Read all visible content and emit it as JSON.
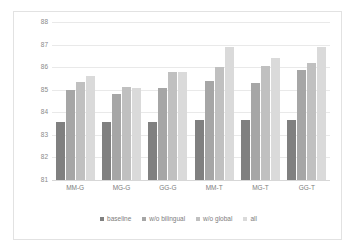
{
  "chart_data": {
    "type": "bar",
    "title": "",
    "xlabel": "",
    "ylabel": "",
    "ylim": [
      81,
      88
    ],
    "yticks": [
      88,
      87,
      86,
      85,
      84,
      83,
      82,
      81
    ],
    "grid": true,
    "legend_position": "bottom",
    "categories": [
      "MM-G",
      "MG-G",
      "GG-G",
      "MM-T",
      "MG-T",
      "GG-T"
    ],
    "series": [
      {
        "name": "baseline",
        "color": "#808080",
        "values": [
          83.55,
          83.55,
          83.55,
          83.67,
          83.67,
          83.67
        ]
      },
      {
        "name": "w/o bilingual",
        "color": "#a6a6a6",
        "values": [
          85.0,
          84.83,
          85.1,
          85.4,
          85.3,
          85.87
        ]
      },
      {
        "name": "w/o global",
        "color": "#c0c0c0",
        "values": [
          85.35,
          85.12,
          85.77,
          86.0,
          86.07,
          86.17
        ]
      },
      {
        "name": "all",
        "color": "#dadada",
        "values": [
          85.6,
          85.07,
          85.8,
          86.88,
          86.4,
          86.88
        ]
      }
    ]
  },
  "axis": {
    "y_tick_labels": [
      "88",
      "87",
      "86",
      "85",
      "84",
      "83",
      "82",
      "81"
    ],
    "x_tick_labels": [
      "MM-G",
      "MG-G",
      "GG-G",
      "MM-T",
      "MG-T",
      "GG-T"
    ]
  },
  "legend": {
    "items": [
      {
        "label": "baseline"
      },
      {
        "label": "w/o bilingual"
      },
      {
        "label": "w/o global"
      },
      {
        "label": "all"
      }
    ]
  }
}
